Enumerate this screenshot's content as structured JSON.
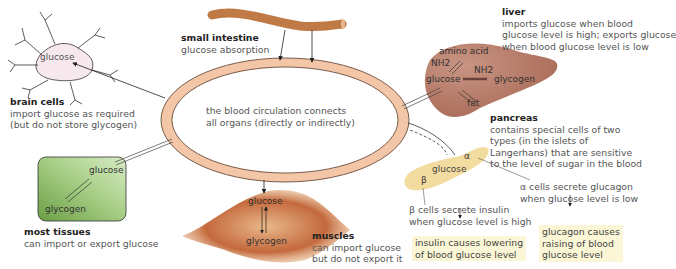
{
  "colors": {
    "circulation_ring": "#f2c6a6",
    "intestine": "#c07a45",
    "liver": "#b57a66",
    "pancreas": "#f3dca0",
    "tissue_box": "#8fbe6a",
    "muscle": "#c2643a",
    "note_box": "#fbf7d6"
  },
  "center": {
    "text_line1": "the blood circulation connects",
    "text_line2": "all organs (directly or indirectly)"
  },
  "small_intestine": {
    "title": "small intestine",
    "desc": "glucose absorption"
  },
  "brain": {
    "title": "brain cells",
    "desc_line1": "import glucose as required",
    "desc_line2": "(but do not store glycogen)",
    "inner_label": "glucose"
  },
  "liver": {
    "title": "liver",
    "desc_line1": "imports glucose when blood",
    "desc_line2": "glucose level is high; exports glucose",
    "desc_line3": "when blood glucose level is low",
    "inner": {
      "amino_acid": "amino acid",
      "nh2_left": "NH2",
      "nh2_right": "NH2",
      "glucose": "glucose",
      "glycogen": "glycogen",
      "fat": "fat"
    }
  },
  "pancreas": {
    "title": "pancreas",
    "desc_line1": "contains special cells of two",
    "desc_line2": "types (in the islets of",
    "desc_line3": "Langerhans) that are sensitive",
    "desc_line4": "to the level of sugar in the blood",
    "inner_glucose": "glucose",
    "alpha_symbol": "α",
    "beta_symbol": "β",
    "alpha_line1": "α  cells secrete glucagon",
    "alpha_line2": "when glucose level is low",
    "beta_line1": "β  cells secrete insulin",
    "beta_line2": "when glucose level is high",
    "insulin_box_line1": "insulin causes lowering",
    "insulin_box_line2": "of blood glucose level",
    "glucagon_box_line1": "glucagon causes",
    "glucagon_box_line2": "raising of blood",
    "glucagon_box_line3": "glucose level"
  },
  "tissues": {
    "title": "most tissues",
    "desc": "can import or export glucose",
    "glucose": "glucose",
    "glycogen": "glycogen"
  },
  "muscles": {
    "title": "muscles",
    "desc_line1": "can import glucose",
    "desc_line2": "but do not export it",
    "glucose": "glucose",
    "glycogen": "glycogen"
  }
}
